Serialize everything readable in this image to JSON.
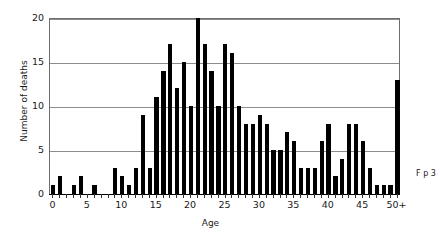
{
  "chart_data": {
    "type": "bar",
    "title": "",
    "xlabel": "Age",
    "ylabel": "Number of deaths",
    "ylim": [
      0,
      20
    ],
    "yticks": [
      0,
      5,
      10,
      15,
      20
    ],
    "xticks": [
      0,
      5,
      10,
      15,
      20,
      25,
      30,
      35,
      40,
      45,
      50
    ],
    "xtick_labels": [
      "0",
      "5",
      "10",
      "15",
      "20",
      "25",
      "30",
      "35",
      "40",
      "45",
      "50+"
    ],
    "grid": "horizontal",
    "legend": "none",
    "bar_color": "#000000",
    "categories": [
      "0",
      "1",
      "2",
      "3",
      "4",
      "5",
      "6",
      "7",
      "8",
      "9",
      "10",
      "11",
      "12",
      "13",
      "14",
      "15",
      "16",
      "17",
      "18",
      "19",
      "20",
      "21",
      "22",
      "23",
      "24",
      "25",
      "26",
      "27",
      "28",
      "29",
      "30",
      "31",
      "32",
      "33",
      "34",
      "35",
      "36",
      "37",
      "38",
      "39",
      "40",
      "41",
      "42",
      "43",
      "44",
      "45",
      "46",
      "47",
      "48",
      "49",
      "50+"
    ],
    "values": [
      1,
      2,
      0,
      1,
      2,
      0,
      1,
      0,
      0,
      3,
      2,
      1,
      3,
      9,
      3,
      11,
      14,
      17,
      12,
      15,
      10,
      20,
      17,
      14,
      10,
      17,
      16,
      10,
      8,
      8,
      9,
      8,
      5,
      5,
      7,
      6,
      3,
      3,
      3,
      6,
      8,
      2,
      4,
      8,
      8,
      6,
      3,
      1,
      1,
      1,
      13
    ]
  },
  "axis": {
    "y_title": "Number of deaths",
    "x_title": "Age"
  },
  "caption": {
    "cropped_text": "F p 3"
  }
}
